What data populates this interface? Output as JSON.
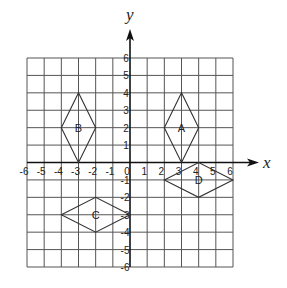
{
  "diagram": {
    "type": "coordinate-grid",
    "axes": {
      "x_label": "x",
      "y_label": "y",
      "x_range": [
        -6,
        6
      ],
      "y_range": [
        -6,
        6
      ],
      "x_ticks": [
        "-6",
        "-5",
        "-4",
        "-3",
        "-2",
        "-1",
        "0",
        "1",
        "2",
        "3",
        "4",
        "5",
        "6"
      ],
      "y_ticks_positive": [
        "1",
        "2",
        "3",
        "4",
        "5",
        "6"
      ],
      "y_ticks_negative": [
        "-1",
        "-2",
        "-3",
        "-4",
        "-5",
        "-6"
      ]
    },
    "colors": {
      "grid": "#555555",
      "axis": "#111111",
      "shape": "#333333",
      "text": "#222222",
      "background": "#ffffff"
    },
    "shapes": [
      {
        "label": "A",
        "vertices": [
          [
            3,
            4
          ],
          [
            4,
            2
          ],
          [
            3,
            0
          ],
          [
            2,
            2
          ]
        ],
        "label_pos": [
          3,
          2
        ]
      },
      {
        "label": "B",
        "vertices": [
          [
            -3,
            4
          ],
          [
            -2,
            2
          ],
          [
            -3,
            0
          ],
          [
            -4,
            2
          ]
        ],
        "label_pos": [
          -3,
          2
        ]
      },
      {
        "label": "C",
        "vertices": [
          [
            -4,
            -3
          ],
          [
            -2,
            -2
          ],
          [
            0,
            -3
          ],
          [
            -2,
            -4
          ]
        ],
        "label_pos": [
          -2,
          -3
        ]
      },
      {
        "label": "D",
        "vertices": [
          [
            2,
            -1
          ],
          [
            4,
            0
          ],
          [
            6,
            -1
          ],
          [
            4,
            -2
          ]
        ],
        "label_pos": [
          4,
          -1
        ]
      }
    ]
  }
}
